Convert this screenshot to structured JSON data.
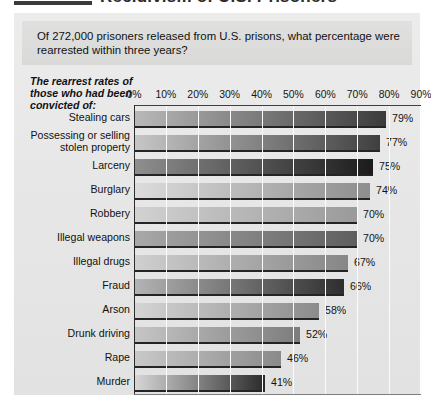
{
  "masthead": {
    "title": "Recidivism of U.S. Prisoners",
    "rule_color": "#3a3a3a"
  },
  "question": {
    "text": "Of 272,000 prisoners released from U.S. prisons, what percentage were rearrested within three years?"
  },
  "stub": {
    "text": "The rearrest rates of those who had been convicted of:"
  },
  "chart_data": {
    "type": "bar",
    "orientation": "horizontal",
    "title": "Recidivism of U.S. Prisoners",
    "subtitle": "Of 272,000 prisoners released from U.S. prisons, what percentage were rearrested within three years?",
    "xlabel": "",
    "ylabel": "The rearrest rates of those who had been convicted of:",
    "xlim": [
      0,
      90
    ],
    "tick_labels": [
      "0%",
      "10%",
      "20%",
      "30%",
      "40%",
      "50%",
      "60%",
      "70%",
      "80%",
      "90%"
    ],
    "tick_values": [
      0,
      10,
      20,
      30,
      40,
      50,
      60,
      70,
      80,
      90
    ],
    "grid": "vertical",
    "legend": "none",
    "value_suffix": "%",
    "categories": [
      "Stealing cars",
      "Possessing or selling stolen property",
      "Larceny",
      "Burglary",
      "Robbery",
      "Illegal weapons",
      "Illegal drugs",
      "Fraud",
      "Arson",
      "Drunk driving",
      "Rape",
      "Murder"
    ],
    "values": [
      79,
      77,
      75,
      74,
      70,
      70,
      67,
      66,
      58,
      52,
      46,
      41
    ],
    "value_labels": [
      "79%",
      "77%",
      "75%",
      "74%",
      "70%",
      "70%",
      "67%",
      "66%",
      "58%",
      "52%",
      "46%",
      "41%"
    ],
    "bars": [
      {
        "label": "Stealing cars",
        "value": 79,
        "value_label": "79%",
        "label_lines": [
          "Stealing cars"
        ],
        "start_color": "#b9b9b9",
        "end_color": "#3b3b3b"
      },
      {
        "label": "Possessing or selling stolen property",
        "value": 77,
        "value_label": "77%",
        "label_lines": [
          "Possessing or selling",
          "stolen property"
        ],
        "start_color": "#c7c7c7",
        "end_color": "#3f3f3f"
      },
      {
        "label": "Larceny",
        "value": 75,
        "value_label": "75%",
        "label_lines": [
          "Larceny"
        ],
        "start_color": "#8f8f8f",
        "end_color": "#1b1b1b"
      },
      {
        "label": "Burglary",
        "value": 74,
        "value_label": "74%",
        "label_lines": [
          "Burglary"
        ],
        "start_color": "#dcdcdc",
        "end_color": "#8e8e8e"
      },
      {
        "label": "Robbery",
        "value": 70,
        "value_label": "70%",
        "label_lines": [
          "Robbery"
        ],
        "start_color": "#d2d2d2",
        "end_color": "#9a9a9a"
      },
      {
        "label": "Illegal weapons",
        "value": 70,
        "value_label": "70%",
        "label_lines": [
          "Illegal weapons"
        ],
        "start_color": "#a9a9a9",
        "end_color": "#5e5e5e"
      },
      {
        "label": "Illegal drugs",
        "value": 67,
        "value_label": "67%",
        "label_lines": [
          "Illegal drugs"
        ],
        "start_color": "#d0d0d0",
        "end_color": "#868686"
      },
      {
        "label": "Fraud",
        "value": 66,
        "value_label": "66%",
        "label_lines": [
          "Fraud"
        ],
        "start_color": "#b4b4b4",
        "end_color": "#2e2e2e"
      },
      {
        "label": "Arson",
        "value": 58,
        "value_label": "58%",
        "label_lines": [
          "Arson"
        ],
        "start_color": "#d5d5d5",
        "end_color": "#8b8b8b"
      },
      {
        "label": "Drunk driving",
        "value": 52,
        "value_label": "52%",
        "label_lines": [
          "Drunk driving"
        ],
        "start_color": "#c6c6c6",
        "end_color": "#7c7c7c"
      },
      {
        "label": "Rape",
        "value": 46,
        "value_label": "46%",
        "label_lines": [
          "Rape"
        ],
        "start_color": "#c9c9c9",
        "end_color": "#8a8a8a"
      },
      {
        "label": "Murder",
        "value": 41,
        "value_label": "41%",
        "label_lines": [
          "Murder"
        ],
        "start_color": "#d8d8d8",
        "end_color": "#2a2a2a"
      }
    ]
  },
  "colors": {
    "card_background": "#e9e9e9",
    "banner_background": "#dededd",
    "axis": "#2c2c2c",
    "gridline": "#fbfbfb",
    "text": "#111111"
  }
}
